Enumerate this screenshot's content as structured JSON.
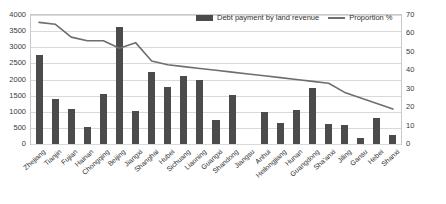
{
  "chart_data": {
    "type": "bar",
    "title": "",
    "subtitle": "",
    "xlabel": "",
    "ylabel": "",
    "y2label": "",
    "grid": true,
    "legend_position": "top-center",
    "ylim": [
      0,
      4000
    ],
    "y2lim": [
      0,
      70
    ],
    "yticks": [
      "0",
      "500",
      "1000",
      "1500",
      "2000",
      "2500",
      "3000",
      "3500",
      "4000"
    ],
    "y2ticks": [
      "0",
      "10",
      "20",
      "30",
      "40",
      "50",
      "60",
      "70"
    ],
    "categories": [
      "Zhejiang",
      "Tianjin",
      "Fujian",
      "Hainan",
      "Chongqing",
      "Beijing",
      "Jiangxi",
      "Shanghai",
      "Hubei",
      "Sichuang",
      "Liaoning",
      "Guangxi",
      "Shandong",
      "Jiangsu",
      "Anhui",
      "Heilongjiang",
      "Hunan",
      "Guangdong",
      "Sha'anxi",
      "Jiling",
      "Gansu",
      "Hebei",
      "Shanxi"
    ],
    "series": [
      {
        "name": "Debt payment by land revenue",
        "type": "bar",
        "axis": "left",
        "color": "#4b4b4b",
        "values": [
          2750,
          1400,
          1080,
          520,
          1550,
          3620,
          1030,
          2220,
          1780,
          2120,
          1980,
          750,
          1520,
          0,
          1000,
          660,
          1040,
          1740,
          620,
          580,
          200,
          820,
          280
        ]
      },
      {
        "name": "Proportion %",
        "type": "line",
        "axis": "right",
        "color": "#6e6e6e",
        "values": [
          66,
          65,
          58,
          56,
          56,
          52,
          55,
          45,
          43,
          42,
          41,
          40,
          39,
          38,
          37,
          36,
          35,
          34,
          33,
          28,
          25,
          22,
          19
        ]
      }
    ]
  },
  "legend": {
    "bar_label": "Debt payment by land revenue",
    "line_label": "Proportion %"
  }
}
